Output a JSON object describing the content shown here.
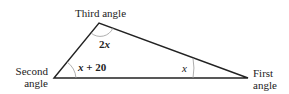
{
  "diagram": {
    "type": "triangle",
    "vertices": {
      "first": {
        "label_line1": "First",
        "label_line2": "angle",
        "angle_expr": "x"
      },
      "second": {
        "label_line1": "Second",
        "label_line2": "angle",
        "angle_expr_var": "x",
        "angle_expr_rest": " + 20"
      },
      "third": {
        "label": "Third angle",
        "angle_expr_num": "2",
        "angle_expr_var": "x"
      }
    },
    "colors": {
      "line": "#222222",
      "arc": "#9a9a9a"
    }
  }
}
